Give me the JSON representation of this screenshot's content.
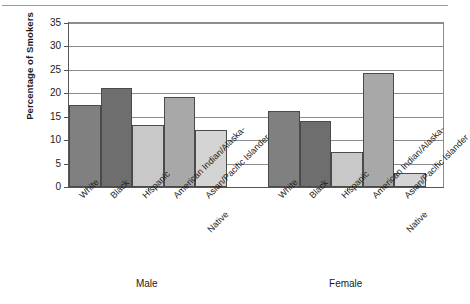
{
  "chart_data": {
    "type": "bar",
    "title": "",
    "xlabel": "",
    "ylabel": "Percentage of Smokers",
    "ylim": [
      0,
      35
    ],
    "ytick_values": [
      0,
      5,
      10,
      15,
      20,
      25,
      30,
      35
    ],
    "ytick_labels": [
      "0",
      "5",
      "10",
      "15",
      "20",
      "25",
      "30",
      "35"
    ],
    "grid": "horizontal",
    "legend": "none",
    "categories": [
      "White",
      "Black",
      "Hispanic",
      "American Indian/Alaska-Native",
      "Asian/Pacific Islander"
    ],
    "category_labels_wrapped": [
      [
        "White"
      ],
      [
        "Black"
      ],
      [
        "Hispanic"
      ],
      [
        "American Indian/Alaska-",
        "Native"
      ],
      [
        "Asian/Pacific Islander"
      ]
    ],
    "groups": [
      "Male",
      "Female"
    ],
    "series": [
      {
        "name": "Male",
        "values": [
          17.4,
          21.1,
          13.2,
          19.3,
          12.1
        ]
      },
      {
        "name": "Female",
        "values": [
          16.3,
          14.0,
          7.5,
          24.4,
          2.9
        ]
      }
    ],
    "bar_colors": [
      "#808080",
      "#6e6e6e",
      "#c8c8c8",
      "#a8a8a8",
      "#d4d4d4"
    ],
    "bar_edge_color": "#4a4a4a",
    "axis_color": "#555555",
    "grid_color": "#8d8d8d",
    "background": "#ffffff"
  }
}
